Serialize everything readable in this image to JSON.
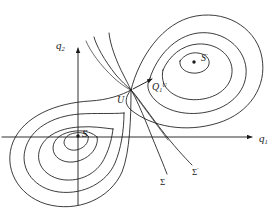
{
  "figure": {
    "kind": "phase-portrait",
    "background_color": "#ffffff",
    "stroke_color": "#1a1a1a"
  },
  "axes": {
    "x_axis": {
      "label": "q",
      "label_sub": "1",
      "arrow": true,
      "y_pixel": 137,
      "x_start": 2,
      "x_end": 256
    },
    "y_axis": {
      "label": "q",
      "label_sub": "2",
      "arrow": true,
      "x_pixel": 78,
      "y_start": 205,
      "y_end": 44
    }
  },
  "critical_points": [
    {
      "id": "S",
      "label": "S",
      "label_sup": "",
      "type": "center",
      "x": 78,
      "y": 136,
      "dot": true
    },
    {
      "id": "Sprime",
      "label": "S",
      "label_sup": "′",
      "type": "center",
      "x": 194,
      "y": 62,
      "dot": true
    },
    {
      "id": "U",
      "label": "U",
      "label_sup": "",
      "type": "saddle",
      "x": 131,
      "y": 90,
      "dot": false
    }
  ],
  "vector_label": {
    "label": "Q",
    "sub": "1",
    "sup": "U",
    "arrow_from_x": 134,
    "arrow_from_y": 89,
    "arrow_to_x": 154,
    "arrow_to_y": 78
  },
  "separatrices": [
    {
      "id": "Sigma",
      "label": "Σ",
      "sup": "",
      "x": 160,
      "y": 178
    },
    {
      "id": "Sigmap",
      "label": "Σ",
      "sup": "′",
      "x": 192,
      "y": 168
    }
  ],
  "orbits": {
    "left_center_count": 4,
    "right_center_count": 4,
    "note": "Nested closed orbits encircling each center, bounded by the homoclinic separatrix loops through the saddle U"
  }
}
